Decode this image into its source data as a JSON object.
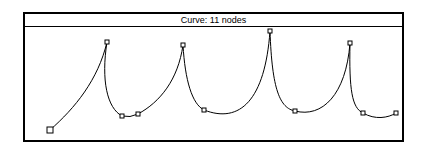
{
  "window": {
    "title": "Curve:   11 nodes"
  },
  "curve": {
    "node_count": 11,
    "stroke_color": "#000000",
    "nodes": [
      {
        "x": 50,
        "y": 130
      },
      {
        "x": 107,
        "y": 42
      },
      {
        "x": 122,
        "y": 116
      },
      {
        "x": 138,
        "y": 114
      },
      {
        "x": 183,
        "y": 45
      },
      {
        "x": 204,
        "y": 110
      },
      {
        "x": 270,
        "y": 31
      },
      {
        "x": 295,
        "y": 111
      },
      {
        "x": 350,
        "y": 43
      },
      {
        "x": 363,
        "y": 113
      },
      {
        "x": 396,
        "y": 113
      }
    ]
  }
}
